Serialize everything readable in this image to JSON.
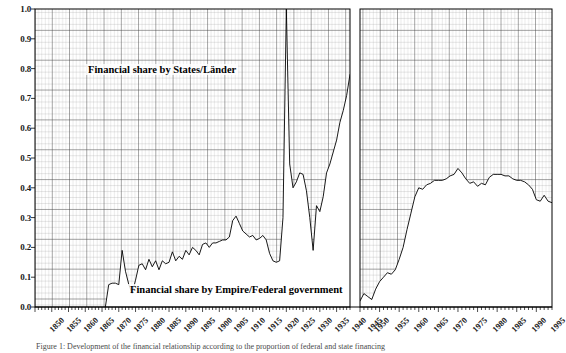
{
  "figure": {
    "caption": "Figure 1: Development of the financial relationship according to the proportion of federal and state financing",
    "annotation_upper": "Financial share by States/Länder",
    "annotation_lower": "Financial share by Empire/Federal government"
  },
  "chart_data": {
    "type": "area",
    "title": "",
    "xlabel": "",
    "ylabel": "",
    "ylim": [
      0.0,
      1.0
    ],
    "xlim": [
      1850,
      1999
    ],
    "grid": true,
    "grid_style": "graph-paper, minor every 1 year / 0.02, major every 5 years / 0.1",
    "legend_position": "inline-annotations",
    "axis_break": {
      "present": true,
      "from_year": 1944,
      "to_year": 1950,
      "reason": "no data during/just after World War II"
    },
    "ytick_labels": [
      "0.0",
      "0.1",
      "0.2",
      "0.3",
      "0.4",
      "0.5",
      "0.6",
      "0.7",
      "0.8",
      "0.9",
      "1.0"
    ],
    "ytick_values": [
      0.0,
      0.1,
      0.2,
      0.3,
      0.4,
      0.5,
      0.6,
      0.7,
      0.8,
      0.9,
      1.0
    ],
    "xtick_labels": [
      "1850",
      "1855",
      "1860",
      "1865",
      "1870",
      "1875",
      "1880",
      "1885",
      "1890",
      "1895",
      "1900",
      "1905",
      "1910",
      "1915",
      "1920",
      "1925",
      "1930",
      "1935",
      "1940",
      "1945",
      "1950",
      "1955",
      "1960",
      "1965",
      "1970",
      "1975",
      "1980",
      "1985",
      "1990",
      "1995"
    ],
    "xtick_values": [
      1850,
      1855,
      1860,
      1865,
      1870,
      1875,
      1880,
      1885,
      1890,
      1895,
      1900,
      1905,
      1910,
      1915,
      1920,
      1925,
      1930,
      1935,
      1940,
      1945,
      1950,
      1955,
      1960,
      1965,
      1970,
      1975,
      1980,
      1985,
      1990,
      1995
    ],
    "series": [
      {
        "name": "Financial share by Empire/Federal government",
        "note": "lower shaded boundary; area above the curve up to 1.0 is the States/Länder share",
        "color": "#000000",
        "segments": [
          {
            "label": "1871-1944",
            "x": [
              1871,
              1872,
              1873,
              1874,
              1875,
              1876,
              1877,
              1878,
              1879,
              1880,
              1881,
              1882,
              1883,
              1884,
              1885,
              1886,
              1887,
              1888,
              1889,
              1890,
              1891,
              1892,
              1893,
              1894,
              1895,
              1896,
              1897,
              1898,
              1899,
              1900,
              1901,
              1902,
              1903,
              1904,
              1905,
              1906,
              1907,
              1908,
              1909,
              1910,
              1911,
              1912,
              1913,
              1914,
              1915,
              1916,
              1917,
              1918,
              1919,
              1920,
              1921,
              1922,
              1923,
              1924,
              1925,
              1926,
              1927,
              1928,
              1929,
              1930,
              1931,
              1932,
              1933,
              1934,
              1935,
              1936,
              1937,
              1938,
              1939,
              1940,
              1941,
              1942,
              1943,
              1944
            ],
            "y": [
              0.0,
              0.075,
              0.08,
              0.08,
              0.075,
              0.19,
              0.12,
              0.075,
              0.045,
              0.09,
              0.14,
              0.145,
              0.125,
              0.16,
              0.135,
              0.155,
              0.125,
              0.155,
              0.145,
              0.15,
              0.185,
              0.155,
              0.17,
              0.16,
              0.19,
              0.175,
              0.2,
              0.19,
              0.175,
              0.21,
              0.215,
              0.2,
              0.215,
              0.215,
              0.22,
              0.225,
              0.225,
              0.235,
              0.29,
              0.305,
              0.28,
              0.255,
              0.245,
              0.235,
              0.24,
              0.225,
              0.23,
              0.24,
              0.225,
              0.18,
              0.155,
              0.15,
              0.155,
              0.3,
              1.0,
              0.48,
              0.4,
              0.42,
              0.45,
              0.445,
              0.39,
              0.3,
              0.19,
              0.34,
              0.32,
              0.37,
              0.45,
              0.48,
              0.52,
              0.56,
              0.62,
              0.66,
              0.71,
              0.78
            ]
          },
          {
            "label": "1950-1999",
            "x": [
              1950,
              1951,
              1952,
              1953,
              1954,
              1955,
              1956,
              1957,
              1958,
              1959,
              1960,
              1961,
              1962,
              1963,
              1964,
              1965,
              1966,
              1967,
              1968,
              1969,
              1970,
              1971,
              1972,
              1973,
              1974,
              1975,
              1976,
              1977,
              1978,
              1979,
              1980,
              1981,
              1982,
              1983,
              1984,
              1985,
              1986,
              1987,
              1988,
              1989,
              1990,
              1991,
              1992,
              1993,
              1994,
              1995,
              1996,
              1997,
              1998,
              1999
            ],
            "y": [
              0.02,
              0.045,
              0.035,
              0.025,
              0.06,
              0.085,
              0.1,
              0.115,
              0.11,
              0.125,
              0.16,
              0.2,
              0.26,
              0.315,
              0.37,
              0.4,
              0.395,
              0.41,
              0.415,
              0.425,
              0.425,
              0.425,
              0.43,
              0.44,
              0.445,
              0.465,
              0.45,
              0.43,
              0.415,
              0.42,
              0.405,
              0.415,
              0.41,
              0.435,
              0.445,
              0.445,
              0.445,
              0.44,
              0.44,
              0.43,
              0.425,
              0.425,
              0.42,
              0.41,
              0.395,
              0.36,
              0.355,
              0.375,
              0.355,
              0.35
            ]
          }
        ]
      }
    ]
  }
}
